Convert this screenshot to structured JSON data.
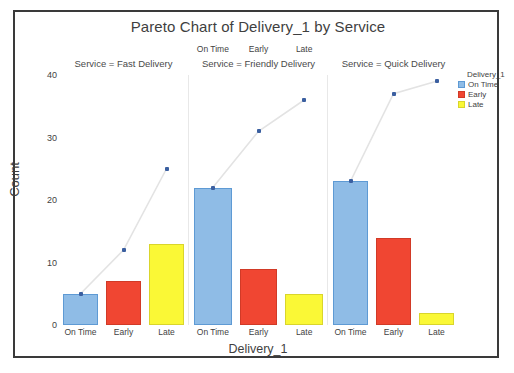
{
  "chart_data": {
    "type": "bar",
    "title": "Pareto Chart of Delivery_1 by Service",
    "xlabel": "Delivery_1",
    "ylabel": "Count",
    "ylim": [
      0,
      40
    ],
    "yticks": [
      0,
      10,
      20,
      30,
      40
    ],
    "grid": false,
    "categories": [
      "On Time",
      "Early",
      "Late"
    ],
    "legend": {
      "position": "right",
      "title": "Delivery_1",
      "entries": [
        {
          "label": "On Time",
          "color": "#8FBCE6"
        },
        {
          "label": "Early",
          "color": "#F04632"
        },
        {
          "label": "Late",
          "color": "#FAF836"
        }
      ]
    },
    "panels": [
      {
        "title": "Service = Fast Delivery",
        "categories": [
          "On Time",
          "Early",
          "Late"
        ],
        "values": [
          5,
          7,
          13
        ],
        "cumulative": [
          5,
          12,
          25
        ]
      },
      {
        "title": "Service = Friendly Delivery",
        "categories": [
          "On Time",
          "Early",
          "Late"
        ],
        "values": [
          22,
          9,
          5
        ],
        "cumulative": [
          22,
          31,
          36
        ]
      },
      {
        "title": "Service = Quick Delivery",
        "categories": [
          "On Time",
          "Early",
          "Late"
        ],
        "values": [
          23,
          14,
          2
        ],
        "cumulative": [
          23,
          37,
          39
        ]
      }
    ],
    "series": [
      {
        "name": "On Time",
        "values": [
          5,
          22,
          23
        ]
      },
      {
        "name": "Early",
        "values": [
          7,
          9,
          14
        ]
      },
      {
        "name": "Late",
        "values": [
          13,
          5,
          2
        ]
      }
    ],
    "cumulative_series_name": "Cumulative Count",
    "cumulative_color": "#3b5fa0"
  }
}
